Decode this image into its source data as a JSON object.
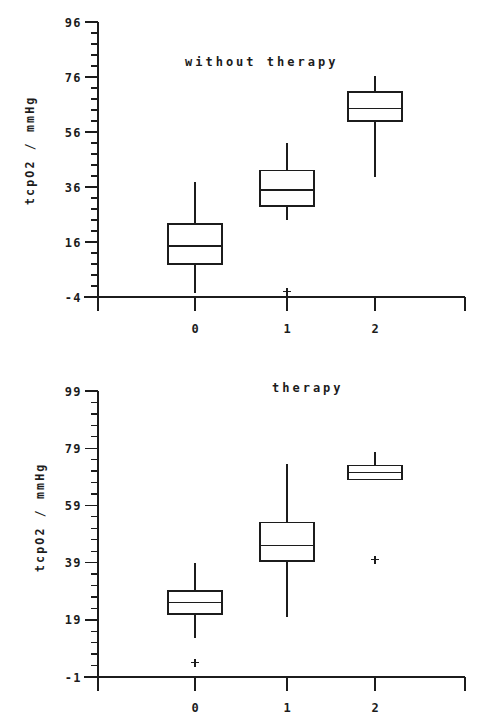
{
  "figure": {
    "background_color": "#ffffff",
    "ink_color": "#1c1c1c",
    "panel_count": 2
  },
  "chart_data": [
    {
      "type": "box",
      "title": "without therapy",
      "xlabel": "",
      "ylabel": "tcpO2 / mmHg",
      "categories": [
        "0",
        "1",
        "2"
      ],
      "ytick_labels": [
        "96",
        "76",
        "56",
        "36",
        "16",
        "-4"
      ],
      "ytick_values": [
        96,
        76,
        56,
        36,
        16,
        -4
      ],
      "ylim": [
        -4,
        96
      ],
      "minor_ticks_per_interval": 4,
      "grid": false,
      "legend": false,
      "boxes": [
        {
          "category": "0",
          "whisker_low": -2.5,
          "q1": 8.0,
          "median": 14.5,
          "q3": 22.5,
          "whisker_high": 38.0,
          "outliers": []
        },
        {
          "category": "1",
          "whisker_low": 24.0,
          "q1": 29.0,
          "median": 35.0,
          "q3": 42.0,
          "whisker_high": 52.0,
          "outliers": [
            -2.0
          ]
        },
        {
          "category": "2",
          "whisker_low": 39.5,
          "q1": 60.0,
          "median": 64.5,
          "q3": 70.5,
          "whisker_high": 76.5,
          "outliers": []
        }
      ]
    },
    {
      "type": "box",
      "title": "therapy",
      "xlabel": "",
      "ylabel": "tcpO2 / mmHg",
      "categories": [
        "0",
        "1",
        "2"
      ],
      "ytick_labels": [
        "99",
        "79",
        "59",
        "39",
        "19",
        "-1"
      ],
      "ytick_values": [
        99,
        79,
        59,
        39,
        19,
        -1
      ],
      "ylim": [
        -1,
        99
      ],
      "minor_ticks_per_interval": 4,
      "grid": false,
      "legend": false,
      "boxes": [
        {
          "category": "0",
          "whisker_low": 12.5,
          "q1": 21.0,
          "median": 25.0,
          "q3": 29.0,
          "whisker_high": 39.0,
          "outliers": [
            4.0
          ]
        },
        {
          "category": "1",
          "whisker_low": 20.0,
          "q1": 39.5,
          "median": 45.0,
          "q3": 53.0,
          "whisker_high": 73.5,
          "outliers": []
        },
        {
          "category": "2",
          "whisker_low": 68.0,
          "q1": 68.0,
          "median": 70.5,
          "q3": 73.0,
          "whisker_high": 77.5,
          "outliers": [
            40.0
          ]
        }
      ]
    }
  ]
}
